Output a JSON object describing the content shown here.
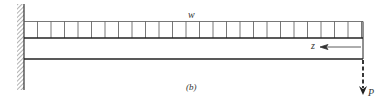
{
  "figure": {
    "caption": "(b)",
    "load_label": "w",
    "axis_label": "z",
    "force_label": "P"
  },
  "colors": {
    "line": "#222222",
    "hatch": "#555555",
    "background": "#ffffff"
  }
}
